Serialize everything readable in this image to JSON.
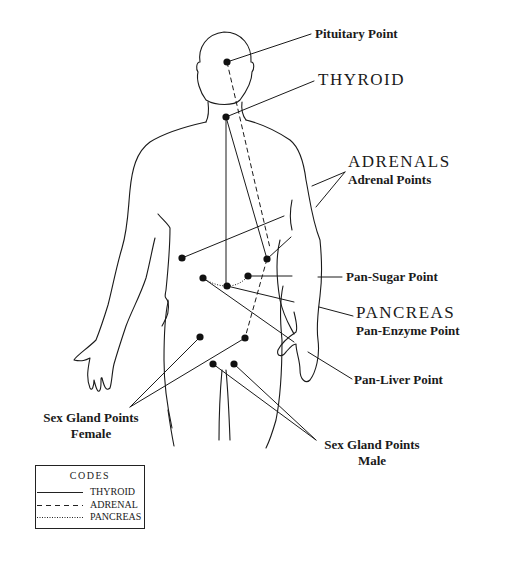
{
  "diagram": {
    "labels": {
      "pituitary": "Pituitary Point",
      "thyroid": "THYROID",
      "adrenals_heading": "ADRENALS",
      "adrenal_points": "Adrenal Points",
      "pan_sugar": "Pan-Sugar Point",
      "pancreas_heading": "PANCREAS",
      "pan_enzyme": "Pan-Enzyme Point",
      "pan_liver": "Pan-Liver Point",
      "sex_female_1": "Sex Gland Points",
      "sex_female_2": "Female",
      "sex_male_1": "Sex Gland Points",
      "sex_male_2": "Male"
    },
    "points": [
      {
        "name": "pituitary",
        "x": 227,
        "y": 62
      },
      {
        "name": "thyroid",
        "x": 226,
        "y": 117
      },
      {
        "name": "adrenal-left",
        "x": 182,
        "y": 258
      },
      {
        "name": "adrenal-right",
        "x": 267,
        "y": 259
      },
      {
        "name": "pancreas-left",
        "x": 203,
        "y": 278
      },
      {
        "name": "pancreas-center",
        "x": 227,
        "y": 286
      },
      {
        "name": "pan-sugar",
        "x": 248,
        "y": 276
      },
      {
        "name": "sex-female-left",
        "x": 200,
        "y": 337
      },
      {
        "name": "sex-female-right",
        "x": 245,
        "y": 338
      },
      {
        "name": "sex-male-left",
        "x": 213,
        "y": 364
      },
      {
        "name": "sex-male-right",
        "x": 234,
        "y": 364
      }
    ],
    "legend": {
      "title": "CODES",
      "items": [
        {
          "label": "THYROID",
          "style": "solid"
        },
        {
          "label": "ADRENAL",
          "style": "dashed"
        },
        {
          "label": "PANCREAS",
          "style": "dotted"
        }
      ]
    },
    "colors": {
      "ink": "#1a1a1a",
      "background": "#ffffff"
    }
  }
}
